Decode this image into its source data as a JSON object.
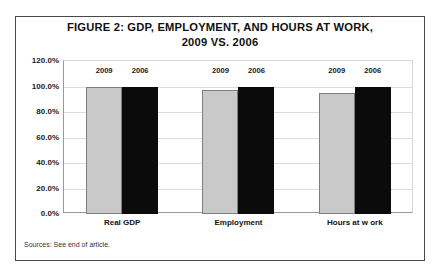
{
  "figure": {
    "title_line1": "FIGURE 2: GDP, EMPLOYMENT, AND HOURS AT WORK,",
    "title_line2": "2009 VS. 2006",
    "source_note": "Sources: See end of article."
  },
  "chart_data": {
    "type": "bar",
    "title": "FIGURE 2: GDP, EMPLOYMENT, AND HOURS AT WORK, 2009 VS. 2006",
    "xlabel": "",
    "ylabel": "",
    "categories": [
      "Real GDP",
      "Employment",
      "Hours at w ork"
    ],
    "series": [
      {
        "name": "2009",
        "color": "#c9c9c9",
        "values": [
          100.0,
          97.5,
          95.0
        ]
      },
      {
        "name": "2006",
        "color": "#0b0b0b",
        "values": [
          100.0,
          100.0,
          100.0
        ]
      }
    ],
    "ylim": [
      0,
      120
    ],
    "ytick_values": [
      0,
      20,
      40,
      60,
      80,
      100,
      120
    ],
    "ytick_labels": [
      "0.0%",
      "20.0%",
      "40.0%",
      "60.0%",
      "80.0%",
      "100.0%",
      "120.0%"
    ],
    "grid": true,
    "legend": "inline-above-bars",
    "annotations": [
      "Sources: See end of article."
    ]
  }
}
